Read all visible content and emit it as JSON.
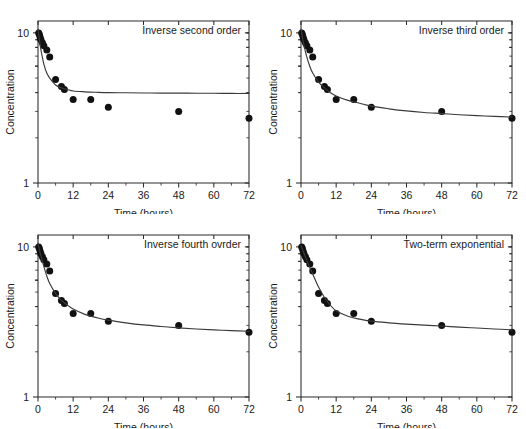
{
  "figure": {
    "layout": "2x2 grid of semi-log decay plots",
    "background": "#ffffff",
    "marker_color": "#111111",
    "curve_color": "#3a3a3a",
    "axis_color": "#2b2b2b"
  },
  "chart_data": [
    {
      "type": "scatter",
      "title": "Inverse second order",
      "xlabel": "Time (hours)",
      "ylabel": "Concentration",
      "xlim": [
        0,
        72
      ],
      "ylim": [
        1,
        12
      ],
      "yscale": "log",
      "xticks": [
        0,
        12,
        24,
        36,
        48,
        60,
        72
      ],
      "xticklabels": [
        "0",
        "12",
        "24",
        "36",
        "48",
        "60",
        "72"
      ],
      "yticks": [
        1,
        10
      ],
      "yticklabels": [
        "1",
        "10"
      ],
      "grid": false,
      "legend": false,
      "series": [
        {
          "name": "observed",
          "kind": "markers",
          "x": [
            0.25,
            0.5,
            0.75,
            1,
            1.5,
            2,
            3,
            4,
            6,
            8,
            9,
            12,
            18,
            24,
            48,
            72
          ],
          "y": [
            10.0,
            9.7,
            9.3,
            9.0,
            8.6,
            8.2,
            7.7,
            6.9,
            4.9,
            4.4,
            4.2,
            3.6,
            3.6,
            3.2,
            3.0,
            2.7
          ]
        },
        {
          "name": "inverse second order fit",
          "kind": "line",
          "x": [
            0,
            0.5,
            1,
            2,
            3,
            4,
            6,
            8,
            10,
            12,
            16,
            20,
            24,
            30,
            36,
            42,
            48,
            54,
            60,
            66,
            72
          ],
          "y": [
            10.6,
            9.0,
            7.7,
            6.2,
            5.4,
            5.0,
            4.5,
            4.3,
            4.2,
            4.1,
            4.05,
            4.02,
            4.0,
            3.99,
            3.98,
            3.97,
            3.97,
            3.96,
            3.96,
            3.95,
            3.95
          ]
        }
      ]
    },
    {
      "type": "scatter",
      "title": "Inverse third order",
      "xlabel": "Time (hours)",
      "ylabel": "Concentration",
      "xlim": [
        0,
        72
      ],
      "ylim": [
        1,
        12
      ],
      "yscale": "log",
      "xticks": [
        0,
        12,
        24,
        36,
        48,
        60,
        72
      ],
      "xticklabels": [
        "0",
        "12",
        "24",
        "36",
        "48",
        "60",
        "72"
      ],
      "yticks": [
        1,
        10
      ],
      "yticklabels": [
        "1",
        "10"
      ],
      "grid": false,
      "legend": false,
      "series": [
        {
          "name": "observed",
          "kind": "markers",
          "x": [
            0.25,
            0.5,
            0.75,
            1,
            1.5,
            2,
            3,
            4,
            6,
            8,
            9,
            12,
            18,
            24,
            48,
            72
          ],
          "y": [
            10.0,
            9.7,
            9.3,
            9.0,
            8.6,
            8.2,
            7.7,
            6.9,
            4.9,
            4.4,
            4.2,
            3.6,
            3.6,
            3.2,
            3.0,
            2.7
          ]
        },
        {
          "name": "inverse third order fit",
          "kind": "line",
          "x": [
            0,
            0.5,
            1,
            2,
            3,
            4,
            6,
            8,
            10,
            12,
            16,
            20,
            24,
            30,
            36,
            42,
            48,
            54,
            60,
            66,
            72
          ],
          "y": [
            10.6,
            9.3,
            8.3,
            6.9,
            6.0,
            5.4,
            4.7,
            4.3,
            4.0,
            3.8,
            3.55,
            3.4,
            3.25,
            3.12,
            3.02,
            2.95,
            2.9,
            2.85,
            2.81,
            2.78,
            2.75
          ]
        }
      ]
    },
    {
      "type": "scatter",
      "title": "Inverse fourth ovrder",
      "xlabel": "Time (hours)",
      "ylabel": "Concentration",
      "xlim": [
        0,
        72
      ],
      "ylim": [
        1,
        12
      ],
      "yscale": "log",
      "xticks": [
        0,
        12,
        24,
        36,
        48,
        60,
        72
      ],
      "xticklabels": [
        "0",
        "12",
        "24",
        "36",
        "48",
        "60",
        "72"
      ],
      "yticks": [
        1,
        10
      ],
      "yticklabels": [
        "1",
        "10"
      ],
      "grid": false,
      "legend": false,
      "series": [
        {
          "name": "observed",
          "kind": "markers",
          "x": [
            0.25,
            0.5,
            0.75,
            1,
            1.5,
            2,
            3,
            4,
            6,
            8,
            9,
            12,
            18,
            24,
            48,
            72
          ],
          "y": [
            10.0,
            9.7,
            9.3,
            9.0,
            8.6,
            8.2,
            7.7,
            6.9,
            4.9,
            4.4,
            4.2,
            3.6,
            3.6,
            3.2,
            3.0,
            2.7
          ]
        },
        {
          "name": "inverse fourth order fit",
          "kind": "line",
          "x": [
            0,
            0.5,
            1,
            2,
            3,
            4,
            6,
            8,
            10,
            12,
            16,
            20,
            24,
            30,
            36,
            42,
            48,
            54,
            60,
            66,
            72
          ],
          "y": [
            10.6,
            9.5,
            8.7,
            7.4,
            6.4,
            5.7,
            4.9,
            4.4,
            4.1,
            3.85,
            3.55,
            3.38,
            3.25,
            3.12,
            3.02,
            2.95,
            2.89,
            2.84,
            2.8,
            2.77,
            2.74
          ]
        }
      ]
    },
    {
      "type": "scatter",
      "title": "Two-term exponential",
      "xlabel": "Time (hours)",
      "ylabel": "Concentration",
      "xlim": [
        0,
        72
      ],
      "ylim": [
        1,
        12
      ],
      "yscale": "log",
      "xticks": [
        0,
        12,
        24,
        36,
        48,
        60,
        72
      ],
      "xticklabels": [
        "0",
        "12",
        "24",
        "36",
        "48",
        "60",
        "72"
      ],
      "yticks": [
        1,
        10
      ],
      "yticklabels": [
        "1",
        "10"
      ],
      "grid": false,
      "legend": false,
      "series": [
        {
          "name": "observed",
          "kind": "markers",
          "x": [
            0.25,
            0.5,
            0.75,
            1,
            1.5,
            2,
            3,
            4,
            6,
            8,
            9,
            12,
            18,
            24,
            48,
            72
          ],
          "y": [
            10.0,
            9.7,
            9.3,
            9.0,
            8.6,
            8.2,
            7.7,
            6.9,
            4.9,
            4.4,
            4.2,
            3.6,
            3.6,
            3.2,
            3.0,
            2.7
          ]
        },
        {
          "name": "two-term exponential fit",
          "kind": "line",
          "x": [
            0,
            0.5,
            1,
            2,
            3,
            4,
            6,
            8,
            10,
            12,
            16,
            20,
            24,
            30,
            36,
            42,
            48,
            54,
            60,
            66,
            72
          ],
          "y": [
            10.2,
            9.6,
            9.1,
            8.1,
            7.3,
            6.6,
            5.4,
            4.6,
            4.1,
            3.75,
            3.45,
            3.3,
            3.2,
            3.12,
            3.06,
            3.01,
            2.97,
            2.92,
            2.88,
            2.84,
            2.8
          ]
        }
      ]
    }
  ]
}
